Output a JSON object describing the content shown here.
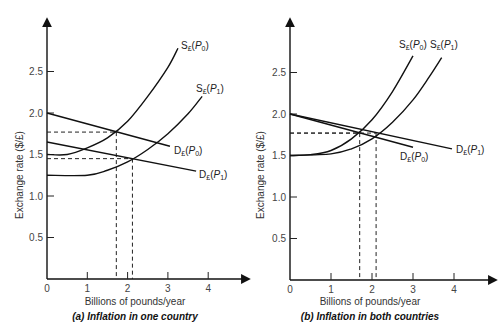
{
  "chart_data": [
    {
      "type": "line",
      "title": "(a) Inflation in one country",
      "xlabel": "Billions of pounds/year",
      "ylabel": "Exchange rate ($/£)",
      "xlim": [
        0,
        4.5
      ],
      "ylim": [
        0,
        3.0
      ],
      "x_ticks": [
        "0",
        "1",
        "2",
        "3",
        "4"
      ],
      "y_ticks": [
        "0.5",
        "1.0",
        "1.5",
        "2.0",
        "2.5"
      ],
      "grid": false,
      "series": [
        {
          "name": "S£(P0)",
          "label": {
            "main": "S",
            "sub": "£",
            "arg": "P",
            "argsub": "0"
          },
          "kind": "supply",
          "points": [
            [
              0,
              1.5
            ],
            [
              0.5,
              1.5
            ],
            [
              1.0,
              1.58
            ],
            [
              1.5,
              1.7
            ],
            [
              2.0,
              1.9
            ],
            [
              2.5,
              2.2
            ],
            [
              3.0,
              2.55
            ],
            [
              3.25,
              2.78
            ]
          ]
        },
        {
          "name": "S£(P1)",
          "label": {
            "main": "S",
            "sub": "£",
            "arg": "P",
            "argsub": "1"
          },
          "kind": "supply",
          "points": [
            [
              0,
              1.25
            ],
            [
              1.0,
              1.25
            ],
            [
              1.5,
              1.31
            ],
            [
              2.0,
              1.41
            ],
            [
              2.5,
              1.56
            ],
            [
              3.0,
              1.75
            ],
            [
              3.5,
              1.99
            ],
            [
              3.85,
              2.2
            ]
          ]
        },
        {
          "name": "D£(P0)",
          "label": {
            "main": "D",
            "sub": "£",
            "arg": "P",
            "argsub": "0"
          },
          "kind": "demand",
          "points": [
            [
              0,
              2.0
            ],
            [
              3.05,
              1.6
            ]
          ]
        },
        {
          "name": "D£(P1)",
          "label": {
            "main": "D",
            "sub": "£",
            "arg": "P",
            "argsub": "1"
          },
          "kind": "demand",
          "points": [
            [
              0,
              1.65
            ],
            [
              3.7,
              1.3
            ]
          ]
        }
      ],
      "equilibria": [
        {
          "x": 1.72,
          "y": 1.77
        },
        {
          "x": 2.12,
          "y": 1.45
        }
      ]
    },
    {
      "type": "line",
      "title": "(b) Inflation in both countries",
      "xlabel": "Billions of pounds/year",
      "ylabel": "Exchange rate ($/£)",
      "xlim": [
        0,
        4.5
      ],
      "ylim": [
        0,
        3.0
      ],
      "x_ticks": [
        "0",
        "1",
        "2",
        "3",
        "4"
      ],
      "y_ticks": [
        "0.5",
        "1.0",
        "1.5",
        "2.0",
        "2.5"
      ],
      "grid": false,
      "series": [
        {
          "name": "S£(P0)",
          "label": {
            "main": "S",
            "sub": "£",
            "arg": "P",
            "argsub": "0"
          },
          "kind": "supply",
          "points": [
            [
              0,
              1.5
            ],
            [
              0.5,
              1.51
            ],
            [
              1.0,
              1.56
            ],
            [
              1.5,
              1.7
            ],
            [
              2.0,
              1.93
            ],
            [
              2.5,
              2.27
            ],
            [
              3.0,
              2.7
            ]
          ]
        },
        {
          "name": "S£(P1)",
          "label": {
            "main": "S",
            "sub": "£",
            "arg": "P",
            "argsub": "1"
          },
          "kind": "supply",
          "points": [
            [
              0,
              1.5
            ],
            [
              1.0,
              1.52
            ],
            [
              1.5,
              1.58
            ],
            [
              2.0,
              1.7
            ],
            [
              2.5,
              1.9
            ],
            [
              3.0,
              2.17
            ],
            [
              3.4,
              2.45
            ],
            [
              3.7,
              2.68
            ]
          ]
        },
        {
          "name": "D£(P0)",
          "label": {
            "main": "D",
            "sub": "£",
            "arg": "P",
            "argsub": "0"
          },
          "kind": "demand",
          "points": [
            [
              0,
              2.0
            ],
            [
              3.0,
              1.6
            ]
          ]
        },
        {
          "name": "D£(P1)",
          "label": {
            "main": "D",
            "sub": "£",
            "arg": "P",
            "argsub": "1"
          },
          "kind": "demand",
          "points": [
            [
              0,
              2.0
            ],
            [
              3.95,
              1.58
            ]
          ]
        }
      ],
      "equilibria": [
        {
          "x": 1.7,
          "y": 1.77
        },
        {
          "x": 2.1,
          "y": 1.77
        }
      ]
    }
  ]
}
